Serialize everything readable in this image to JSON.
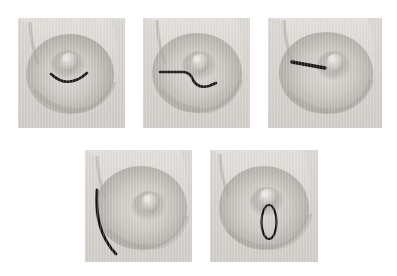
{
  "figure": {
    "title": "",
    "caption": "",
    "background_color": "#ffffff",
    "panel_count": 5,
    "layout": {
      "rows": 2,
      "row1_panels": 3,
      "row2_panels": 2
    }
  },
  "palette": {
    "skin_light": "#d9d6d2",
    "skin_mid": "#bdb9b4",
    "skin_shadow": "#9b9792",
    "skin_deep_shadow": "#84807c",
    "nipple_highlight": "#e3e0dc",
    "marking_ink": "#141414",
    "background": "#ffffff",
    "scanline": "#ffffff"
  },
  "panels": [
    {
      "id": "panel-1",
      "index": 1,
      "position": {
        "x": 18,
        "y": 18,
        "width": 107,
        "height": 110
      },
      "subject": "breast-frontal-view",
      "marking": {
        "name": "periareolar-incision",
        "shape": "arc",
        "description": "Semicircular arc along the inferior areolar border",
        "color": "#141414",
        "stroke_width": 2.6
      }
    },
    {
      "id": "panel-2",
      "index": 2,
      "position": {
        "x": 143,
        "y": 18,
        "width": 107,
        "height": 110
      },
      "subject": "breast-frontal-view",
      "marking": {
        "name": "periareolar-incision-with-radial-extension",
        "shape": "line-plus-arc",
        "description": "Horizontal medial line descending into an arc beneath the areola",
        "color": "#141414",
        "stroke_width": 2.6
      }
    },
    {
      "id": "panel-3",
      "index": 3,
      "position": {
        "x": 268,
        "y": 18,
        "width": 114,
        "height": 110
      },
      "subject": "breast-frontal-view",
      "marking": {
        "name": "radial-incision",
        "shape": "straight-line",
        "description": "Short straight radial line extending medially from the areola",
        "color": "#141414",
        "stroke_width": 3.4
      }
    },
    {
      "id": "panel-4",
      "index": 4,
      "position": {
        "x": 85,
        "y": 150,
        "width": 107,
        "height": 112
      },
      "subject": "breast-frontal-view",
      "marking": {
        "name": "curvilinear-border-incision",
        "shape": "long-crescent-arc",
        "description": "Long crescent curve following the medial breast border",
        "color": "#141414",
        "stroke_width": 2.8
      }
    },
    {
      "id": "panel-5",
      "index": 5,
      "position": {
        "x": 210,
        "y": 150,
        "width": 108,
        "height": 112
      },
      "subject": "breast-frontal-view",
      "marking": {
        "name": "elliptical-excision",
        "shape": "vertical-ellipse",
        "description": "Narrow vertical lenticular ellipse immediately inferior to the nipple",
        "color": "#141414",
        "stroke_width": 2.2
      }
    }
  ]
}
